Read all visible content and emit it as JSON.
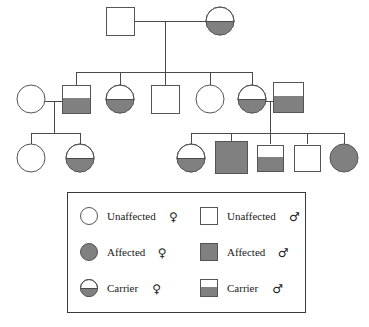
{
  "figure": {
    "type": "pedigree-chart",
    "background_color": "#ffffff",
    "line_color": "#4a4a4a",
    "symbol_outline_color": "#555555",
    "fill_color": "#808080",
    "unaffected_fill": "#ffffff"
  },
  "legend": {
    "box": {
      "x": 67,
      "y": 192,
      "width": 238,
      "height": 120
    },
    "entries": [
      {
        "id": "unaffected-female",
        "label": "Unaffected",
        "sex_symbol": "♀",
        "shape": "circle",
        "fill": "none"
      },
      {
        "id": "affected-female",
        "label": "Affected",
        "sex_symbol": "♀",
        "shape": "circle",
        "fill": "full"
      },
      {
        "id": "carrier-female",
        "label": "Carrier",
        "sex_symbol": "♀",
        "shape": "circle",
        "fill": "bottom-half"
      },
      {
        "id": "unaffected-male",
        "label": "Unaffected",
        "sex_symbol": "♂",
        "shape": "square",
        "fill": "none"
      },
      {
        "id": "affected-male",
        "label": "Affected",
        "sex_symbol": "♂",
        "shape": "square",
        "fill": "full"
      },
      {
        "id": "carrier-male",
        "label": "Carrier",
        "sex_symbol": "♂",
        "shape": "square",
        "fill": "bottom-half"
      }
    ]
  },
  "generations": [
    {
      "id": "generation-1",
      "individuals": [
        {
          "id": "I-1",
          "shape": "square",
          "status": "unaffected",
          "fill": "none",
          "cx": 120,
          "cy": 21,
          "size": 28
        },
        {
          "id": "I-2",
          "shape": "circle",
          "status": "carrier",
          "fill": "bottom-half",
          "cx": 220,
          "cy": 21,
          "size": 28
        }
      ]
    },
    {
      "id": "generation-2",
      "individuals": [
        {
          "id": "II-1",
          "shape": "circle",
          "status": "unaffected",
          "fill": "none",
          "cx": 31,
          "cy": 99,
          "size": 28
        },
        {
          "id": "II-2",
          "shape": "square",
          "status": "carrier",
          "fill": "bottom-half",
          "cx": 76,
          "cy": 99,
          "size": 28
        },
        {
          "id": "II-3",
          "shape": "circle",
          "status": "carrier",
          "fill": "bottom-half",
          "cx": 120,
          "cy": 99,
          "size": 28
        },
        {
          "id": "II-4",
          "shape": "square",
          "status": "unaffected",
          "fill": "none",
          "cx": 165,
          "cy": 99,
          "size": 28
        },
        {
          "id": "II-5",
          "shape": "circle",
          "status": "unaffected",
          "fill": "none",
          "cx": 210,
          "cy": 99,
          "size": 28
        },
        {
          "id": "II-6",
          "shape": "circle",
          "status": "carrier",
          "fill": "bottom-half",
          "cx": 252,
          "cy": 99,
          "size": 28
        },
        {
          "id": "II-7",
          "shape": "square",
          "status": "carrier",
          "fill": "bottom-half",
          "cx": 288,
          "cy": 97,
          "size": 30
        }
      ]
    },
    {
      "id": "generation-3",
      "individuals": [
        {
          "id": "III-1",
          "shape": "circle",
          "status": "unaffected",
          "fill": "none",
          "cx": 31,
          "cy": 158,
          "size": 28
        },
        {
          "id": "III-2",
          "shape": "circle",
          "status": "carrier",
          "fill": "bottom-half",
          "cx": 80,
          "cy": 158,
          "size": 28
        },
        {
          "id": "III-3",
          "shape": "circle",
          "status": "carrier",
          "fill": "bottom-half",
          "cx": 191,
          "cy": 158,
          "size": 28
        },
        {
          "id": "III-4",
          "shape": "square",
          "status": "affected",
          "fill": "full",
          "cx": 231,
          "cy": 157,
          "size": 32
        },
        {
          "id": "III-5",
          "shape": "square",
          "status": "carrier",
          "fill": "bottom-half",
          "cx": 270,
          "cy": 158,
          "size": 26
        },
        {
          "id": "III-6",
          "shape": "square",
          "status": "unaffected",
          "fill": "none",
          "cx": 307,
          "cy": 158,
          "size": 26
        },
        {
          "id": "III-7",
          "shape": "circle",
          "status": "affected",
          "fill": "full",
          "cx": 344,
          "cy": 158,
          "size": 28
        }
      ]
    }
  ],
  "matings": [
    {
      "id": "mating-I",
      "partners": [
        "I-1",
        "I-2"
      ],
      "line_y": 21,
      "x1": 134,
      "x2": 206,
      "descent_x": 165,
      "descent_y2": 72
    },
    {
      "id": "mating-II-left",
      "partners": [
        "II-1",
        "II-2"
      ],
      "line_y": 101,
      "x1": 45,
      "x2": 62,
      "descent_x": 54,
      "descent_y2": 133
    },
    {
      "id": "mating-II-right",
      "partners": [
        "II-6",
        "II-7"
      ],
      "line_y": 101,
      "x1": 266,
      "x2": 273,
      "descent_x": 270,
      "descent_y2": 133
    }
  ],
  "sibships": [
    {
      "id": "sibship-II",
      "bar_y": 72,
      "x1": 76,
      "x2": 252,
      "children_x": [
        76,
        120,
        165,
        210,
        252
      ],
      "drop_to_y": 85
    },
    {
      "id": "sibship-III-left",
      "bar_y": 133,
      "x1": 31,
      "x2": 80,
      "children_x": [
        31,
        80
      ],
      "drop_to_y": 144
    },
    {
      "id": "sibship-III-right",
      "bar_y": 133,
      "x1": 191,
      "x2": 344,
      "children_x": [
        191,
        231,
        270,
        307,
        344
      ],
      "drop_to_y": 144
    }
  ]
}
